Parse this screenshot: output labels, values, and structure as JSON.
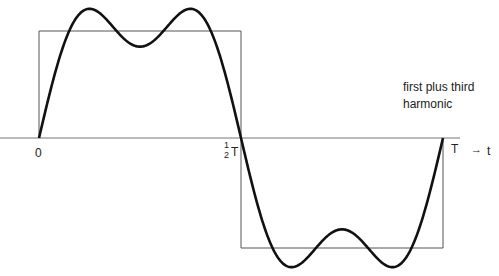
{
  "diagram": {
    "caption_line1": "first plus third",
    "caption_line2": "harmonic",
    "label_zero": "0",
    "label_half_num": "1",
    "label_half_den": "2",
    "label_half_T": "T",
    "label_T": "T",
    "axis_arrow": "→",
    "axis_var": "t",
    "colors": {
      "curve": "#111111",
      "square": "#555555",
      "axis": "#777777"
    }
  },
  "chart_data": {
    "type": "line",
    "xlabel": "t",
    "x_ticks": [
      "0",
      "1/2 T",
      "T"
    ],
    "series": [
      {
        "name": "square wave",
        "description": "+1 for 0<t<T/2, -1 for T/2<t<T"
      },
      {
        "name": "first plus third harmonic",
        "formula": "(4/pi)[sin(2pi t/T) + (1/3) sin(6pi t/T)]"
      }
    ]
  }
}
